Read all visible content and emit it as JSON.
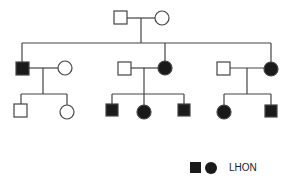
{
  "diagram": {
    "type": "pedigree",
    "colors": {
      "line": "#444444",
      "affected_fill": "#1a1a1a",
      "unaffected_fill": "#ffffff"
    },
    "generations": [
      {
        "label": "I",
        "individuals": [
          {
            "id": "I-1",
            "sex": "male",
            "affected": false
          },
          {
            "id": "I-2",
            "sex": "female",
            "affected": false
          }
        ]
      },
      {
        "label": "II",
        "individuals": [
          {
            "id": "II-1",
            "sex": "male",
            "affected": true
          },
          {
            "id": "II-1-spouse",
            "sex": "female",
            "affected": false
          },
          {
            "id": "II-2-spouse",
            "sex": "male",
            "affected": false
          },
          {
            "id": "II-2",
            "sex": "female",
            "affected": true
          },
          {
            "id": "II-3-spouse",
            "sex": "male",
            "affected": false
          },
          {
            "id": "II-3",
            "sex": "female",
            "affected": true
          }
        ]
      },
      {
        "label": "III",
        "individuals": [
          {
            "id": "III-1",
            "sex": "male",
            "affected": false
          },
          {
            "id": "III-2",
            "sex": "female",
            "affected": false
          },
          {
            "id": "III-3",
            "sex": "male",
            "affected": true
          },
          {
            "id": "III-4",
            "sex": "female",
            "affected": true
          },
          {
            "id": "III-5",
            "sex": "male",
            "affected": true
          },
          {
            "id": "III-6",
            "sex": "female",
            "affected": true
          },
          {
            "id": "III-7",
            "sex": "male",
            "affected": true
          }
        ]
      }
    ],
    "legend": {
      "label": "LHON",
      "symbols": [
        "filled-square",
        "filled-circle"
      ]
    }
  }
}
